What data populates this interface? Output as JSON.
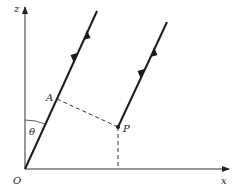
{
  "diagram": {
    "labels": {
      "z_axis": "z",
      "x_axis": "x",
      "origin": "O",
      "point_a": "A",
      "point_p": "P",
      "angle": "θ"
    },
    "colors": {
      "line": "#1a1a1a",
      "axis": "#333333",
      "background": "#ffffff"
    }
  }
}
